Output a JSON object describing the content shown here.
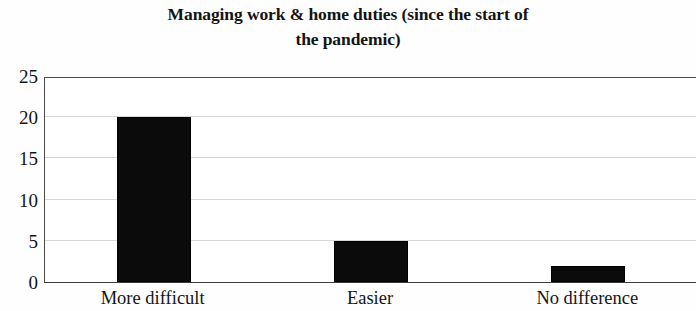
{
  "chart_data": {
    "type": "bar",
    "title": "Managing work & home duties (since the start of\nthe pandemic)",
    "title_line1": "Managing work & home duties (since the start of",
    "title_line2": "the pandemic)",
    "xlabel": "",
    "ylabel": "",
    "categories": [
      "More difficult",
      "Easier",
      "No difference"
    ],
    "values": [
      20,
      5,
      2
    ],
    "ylim": [
      0,
      25
    ],
    "yticks": [
      0,
      5,
      10,
      15,
      20,
      25
    ],
    "ytick_labels": [
      "0",
      "5",
      "10",
      "15",
      "20",
      "25"
    ],
    "grid": true,
    "grid_axis": "y",
    "legend": false,
    "bar_color": "#0b0b0b",
    "gridline_color": "#d8d8d8",
    "axis_color": "#4a4a4a",
    "background_color": "#ffffff"
  }
}
